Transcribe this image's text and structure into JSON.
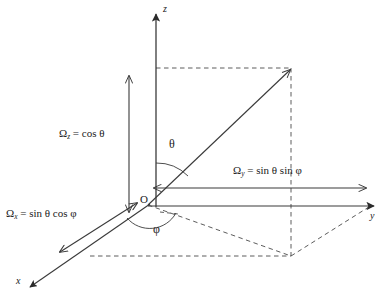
{
  "figure": {
    "background_color": "#ffffff",
    "line_color": "#3a3a3a",
    "text_color": "#1a1a1a"
  },
  "axes": [
    {
      "name": "z-axis",
      "label": "z",
      "direction": "up"
    },
    {
      "name": "y-axis",
      "label": "y",
      "direction": "right"
    },
    {
      "name": "x-axis",
      "label": "x",
      "direction": "down-left"
    }
  ],
  "origin": {
    "label": "O"
  },
  "angles": [
    {
      "name": "polar-angle",
      "label": "θ",
      "between": "z-axis and direction vector"
    },
    {
      "name": "azimuthal-angle",
      "label": "φ",
      "between": "x-axis and projection in xy-plane"
    }
  ],
  "components": [
    {
      "name": "omega-z",
      "symbol": "Ω",
      "subscript": "z",
      "equals": "=",
      "expression": "cos θ",
      "full": "Ωz = cos θ",
      "orientation": "vertical"
    },
    {
      "name": "omega-x",
      "symbol": "Ω",
      "subscript": "x",
      "equals": "=",
      "expression": "sin θ cos φ",
      "full": "Ωx = sin θ cos φ",
      "orientation": "along-x"
    },
    {
      "name": "omega-y",
      "symbol": "Ω",
      "subscript": "y",
      "equals": "=",
      "expression": "sin θ sin φ",
      "full": "Ωy = sin θ sin φ",
      "orientation": "horizontal"
    }
  ]
}
